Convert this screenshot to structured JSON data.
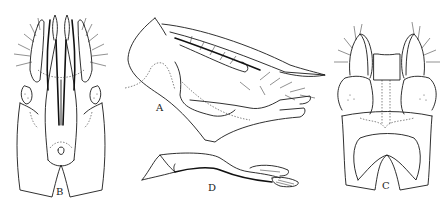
{
  "figure": {
    "background": "#ffffff",
    "line_color": "#1a1a1a",
    "panels": [
      {
        "id": "A",
        "label": "A",
        "view": "lateral"
      },
      {
        "id": "B",
        "label": "B",
        "view": "ventral"
      },
      {
        "id": "C",
        "label": "C",
        "view": "dorsal"
      },
      {
        "id": "D",
        "label": "D",
        "view": "aedeagus"
      }
    ]
  }
}
